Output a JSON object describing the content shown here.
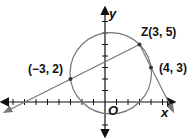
{
  "figure": {
    "type": "coordinate-geometry",
    "axes": {
      "x_label": "x",
      "y_label": "y",
      "origin_label": "O",
      "unit_px": 11.5,
      "origin_px": [
        105,
        102
      ]
    },
    "circle": {
      "center": [
        0.5,
        2.5
      ],
      "radius": 3.54,
      "color": "#777777"
    },
    "points": [
      {
        "name": "Z",
        "label": "Z(3, 5)",
        "coords": [
          3,
          5
        ]
      },
      {
        "name": "P1",
        "label": "(−3, 2)",
        "coords": [
          -3,
          2
        ]
      },
      {
        "name": "P2",
        "label": "(4, 3)",
        "coords": [
          4,
          3
        ]
      }
    ],
    "lines": [
      {
        "through": [
          "Z",
          "P1"
        ],
        "description": "secant through Z and (-3, 2)"
      },
      {
        "through": [
          "Z",
          "P2"
        ],
        "description": "secant through Z and (4, 3)"
      }
    ],
    "colors": {
      "axes": "#111111",
      "lines": "#777777",
      "points": "#333333"
    }
  },
  "labels": {
    "z": "Z(3, 5)",
    "p1": "(−3, 2)",
    "p2": "(4, 3)",
    "x_axis": "x",
    "y_axis": "y",
    "origin": "O"
  }
}
